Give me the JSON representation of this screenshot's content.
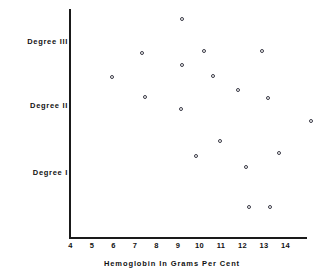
{
  "chart_data": {
    "type": "scatter",
    "title": "",
    "xlabel": "Hemoglobin In Grams Per Cent",
    "ylabel": "",
    "xlim": [
      4,
      15.6
    ],
    "ylim": [
      0,
      3.4
    ],
    "grid": false,
    "legend": null,
    "xticks": [
      "4",
      "5",
      "6",
      "7",
      "8",
      "9",
      "10",
      "11",
      "12",
      "13",
      "14"
    ],
    "xtick_values": [
      4,
      5,
      6,
      7,
      8,
      9,
      10,
      11,
      12,
      13,
      14
    ],
    "ycategories": [
      "Degree I",
      "Degree II",
      "Degree III"
    ],
    "ycategory_labels": {
      "degree_3": "Degree III",
      "degree_2": "Degree II",
      "degree_1": "Degree I"
    },
    "marker": "open-circle",
    "marker_color": "#3a3a46",
    "axis_color": "#1a1a1a",
    "points": [
      {
        "x": 9.2,
        "y": 3.38,
        "px": 182,
        "py": 19
      },
      {
        "x": 7.4,
        "y": 2.85,
        "px": 142,
        "py": 53
      },
      {
        "x": 10.7,
        "y": 2.88,
        "px": 204,
        "py": 51
      },
      {
        "x": 13.4,
        "y": 2.88,
        "px": 262,
        "py": 51
      },
      {
        "x": 9.2,
        "y": 2.66,
        "px": 182,
        "py": 65
      },
      {
        "x": 5.9,
        "y": 2.47,
        "px": 112,
        "py": 77
      },
      {
        "x": 11.0,
        "y": 2.48,
        "px": 213,
        "py": 76
      },
      {
        "x": 7.5,
        "y": 2.16,
        "px": 145,
        "py": 97
      },
      {
        "x": 12.2,
        "y": 2.27,
        "px": 238,
        "py": 90
      },
      {
        "x": 13.2,
        "y": 2.16,
        "px": 268,
        "py": 98
      },
      {
        "x": 9.2,
        "y": 1.98,
        "px": 181,
        "py": 109
      },
      {
        "x": 15.2,
        "y": 1.79,
        "px": 311,
        "py": 121
      },
      {
        "x": 11.2,
        "y": 1.48,
        "px": 220,
        "py": 141
      },
      {
        "x": 10.1,
        "y": 1.25,
        "px": 196,
        "py": 156
      },
      {
        "x": 13.9,
        "y": 1.29,
        "px": 279,
        "py": 153
      },
      {
        "x": 12.3,
        "y": 1.08,
        "px": 246,
        "py": 167
      },
      {
        "x": 12.4,
        "y": 0.46,
        "px": 249,
        "py": 207
      },
      {
        "x": 13.3,
        "y": 0.46,
        "px": 270,
        "py": 207
      }
    ]
  },
  "axis": {
    "x_title": "Hemoglobin In Grams Per Cent"
  }
}
